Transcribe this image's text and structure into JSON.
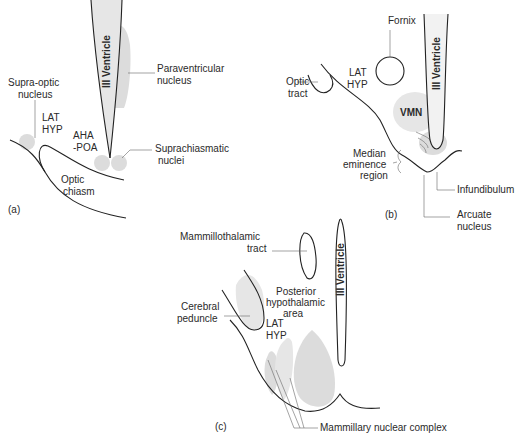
{
  "figure": {
    "panels": [
      {
        "id": "a",
        "label": "(a)",
        "structure_labels": {
          "ventricle": "III Ventricle",
          "paraventricular_1": "Paraventricular",
          "paraventricular_2": "nucleus",
          "supraoptic_1": "Supra-optic",
          "supraoptic_2": "nucleus",
          "lathyp_1": "LAT",
          "lathyp_2": "HYP",
          "ahapoa_1": "AHA",
          "ahapoa_2": "-POA",
          "suprachiasmatic_1": "Suprachiasmatic",
          "suprachiasmatic_2": "nuclei",
          "optic_chiasm_1": "Optic",
          "optic_chiasm_2": "chiasm"
        }
      },
      {
        "id": "b",
        "label": "(b)",
        "structure_labels": {
          "fornix": "Fornix",
          "ventricle": "III Ventricle",
          "optic_tract_1": "Optic",
          "optic_tract_2": "tract",
          "lathyp_1": "LAT",
          "lathyp_2": "HYP",
          "vmn": "VMN",
          "median_eminence_1": "Median",
          "median_eminence_2": "eminence",
          "median_eminence_3": "region",
          "infundibulum": "Infundibulum",
          "arcuate_1": "Arcuate",
          "arcuate_2": "nucleus"
        }
      },
      {
        "id": "c",
        "label": "(c)",
        "structure_labels": {
          "mammillothalamic_1": "Mammillothalamic",
          "mammillothalamic_2": "tract",
          "ventricle": "III Ventricle",
          "posterior_1": "Posterior",
          "posterior_2": "hypothalamic",
          "posterior_3": "area",
          "cerebral_1": "Cerebral",
          "cerebral_2": "peduncle",
          "lathyp_1": "LAT",
          "lathyp_2": "HYP",
          "mammillary": "Mammillary nuclear complex"
        }
      }
    ]
  }
}
